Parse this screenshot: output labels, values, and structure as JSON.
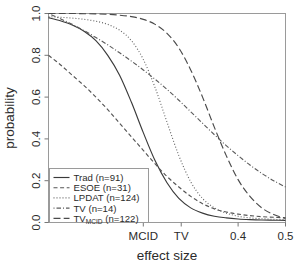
{
  "chart_data": {
    "type": "line",
    "title": "",
    "subtitle": "",
    "xlabel": "effect size",
    "ylabel": "probability",
    "grid": false,
    "legend_position": "bottom-left",
    "xlim": [
      0.0,
      0.5
    ],
    "ylim": [
      0.0,
      1.0
    ],
    "x_ticks": [
      {
        "value": 0.2,
        "label": "MCID"
      },
      {
        "value": 0.28,
        "label": "TV"
      },
      {
        "value": 0.4,
        "label": "0.4"
      },
      {
        "value": 0.5,
        "label": "0.5"
      }
    ],
    "y_ticks": [
      {
        "value": 0.0,
        "label": "0.0"
      },
      {
        "value": 0.2,
        "label": "0.2"
      },
      {
        "value": 0.4,
        "label": "0.4"
      },
      {
        "value": 0.6,
        "label": "0.6"
      },
      {
        "value": 0.8,
        "label": "0.8"
      },
      {
        "value": 1.0,
        "label": "1.0"
      }
    ],
    "x": [
      0.0,
      0.025,
      0.05,
      0.075,
      0.1,
      0.125,
      0.15,
      0.175,
      0.2,
      0.225,
      0.25,
      0.275,
      0.3,
      0.325,
      0.35,
      0.375,
      0.4,
      0.425,
      0.45,
      0.475,
      0.5
    ],
    "series": [
      {
        "name": "Trad (n=91)",
        "label_main": "Trad",
        "label_n": "(n=91)",
        "dash": "solid",
        "color": "#3a3a3a",
        "values": [
          0.98,
          0.965,
          0.945,
          0.915,
          0.87,
          0.8,
          0.705,
          0.575,
          0.43,
          0.295,
          0.19,
          0.115,
          0.07,
          0.045,
          0.03,
          0.022,
          0.017,
          0.014,
          0.012,
          0.011,
          0.01
        ]
      },
      {
        "name": "ESOE (n=31)",
        "label_main": "ESOE",
        "label_n": "(n=31)",
        "dash": "dashed",
        "color": "#555555",
        "values": [
          0.8,
          0.755,
          0.705,
          0.655,
          0.6,
          0.54,
          0.475,
          0.41,
          0.345,
          0.28,
          0.22,
          0.17,
          0.125,
          0.09,
          0.065,
          0.05,
          0.04,
          0.033,
          0.028,
          0.025,
          0.022
        ]
      },
      {
        "name": "LPDAT (n=124)",
        "label_main": "LPDAT",
        "label_n": "(n=124)",
        "dash": "dotted",
        "color": "#666666",
        "values": [
          0.985,
          0.982,
          0.978,
          0.972,
          0.963,
          0.948,
          0.92,
          0.87,
          0.78,
          0.645,
          0.48,
          0.32,
          0.195,
          0.115,
          0.07,
          0.045,
          0.03,
          0.022,
          0.018,
          0.015,
          0.013
        ]
      },
      {
        "name": "TV (n=14)",
        "label_main": "TV",
        "label_n": "(n=14)",
        "dash": "dotdash",
        "color": "#5c5c5c",
        "values": [
          1.0,
          0.975,
          0.948,
          0.918,
          0.885,
          0.85,
          0.812,
          0.772,
          0.73,
          0.685,
          0.637,
          0.585,
          0.53,
          0.475,
          0.42,
          0.368,
          0.32,
          0.275,
          0.235,
          0.2,
          0.17
        ]
      },
      {
        "name": "TVMCID (n=122)",
        "label_main": "TV",
        "label_sub": "MCID",
        "label_n": "(n=122)",
        "dash": "longdash",
        "color": "#4a4a4a",
        "values": [
          1.0,
          1.0,
          1.0,
          0.999,
          0.998,
          0.996,
          0.992,
          0.985,
          0.972,
          0.948,
          0.905,
          0.835,
          0.73,
          0.6,
          0.455,
          0.32,
          0.205,
          0.125,
          0.07,
          0.038,
          0.02
        ]
      }
    ]
  },
  "legend": {
    "items": [
      {
        "main": "Trad",
        "sub": "",
        "n": "(n=91)"
      },
      {
        "main": "ESOE",
        "sub": "",
        "n": "(n=31)"
      },
      {
        "main": "LPDAT",
        "sub": "",
        "n": "(n=124)"
      },
      {
        "main": "TV",
        "sub": "",
        "n": "(n=14)"
      },
      {
        "main": "TV",
        "sub": "MCID",
        "n": "(n=122)"
      }
    ]
  }
}
